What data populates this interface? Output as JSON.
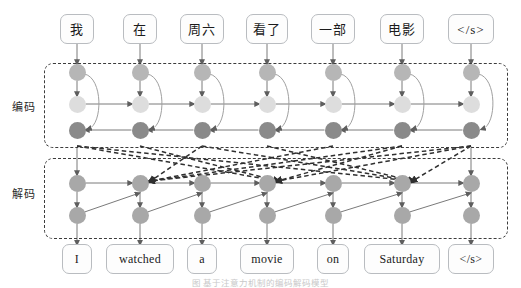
{
  "figure": {
    "caption": "图  基于注意力机制的编码解码模型"
  },
  "sections": {
    "encoder": {
      "label": "编码"
    },
    "decoder": {
      "label": "解码"
    }
  },
  "source_tokens": [
    {
      "text": "我"
    },
    {
      "text": "在"
    },
    {
      "text": "周六"
    },
    {
      "text": "看了"
    },
    {
      "text": "一部"
    },
    {
      "text": "电影"
    },
    {
      "text": "</s>"
    }
  ],
  "target_tokens": [
    {
      "text": "I"
    },
    {
      "text": "watched"
    },
    {
      "text": "a"
    },
    {
      "text": "movie"
    },
    {
      "text": "on"
    },
    {
      "text": "Saturday"
    },
    {
      "text": "</s>"
    }
  ],
  "colors": {
    "node_mid": "#b6b6b6",
    "node_light": "#dddddd",
    "node_dark": "#8a8a8a",
    "node_decoder": "#a8a8a8",
    "frame_border": "#3c3c3c",
    "token_border": "#b9bcc0",
    "arrow": "#6f6f6f",
    "attention_line": "#3a3a3a"
  },
  "layout": {
    "columns": 7,
    "column_x": [
      77,
      140,
      202,
      267,
      333,
      402,
      471
    ],
    "encoder_rows_y": [
      72,
      104,
      130
    ],
    "decoder_rows_y": [
      183,
      215
    ],
    "source_box_y": 14,
    "target_box_y": 244,
    "encoder_frame": {
      "x": 44,
      "y": 63,
      "w": 464,
      "h": 85
    },
    "decoder_frame": {
      "x": 44,
      "y": 158,
      "w": 464,
      "h": 81
    }
  },
  "chart_data": {
    "type": "diagram",
    "encoder": {
      "label": "编码",
      "layers": [
        {
          "name": "embedding",
          "shade": "mid",
          "count": 7
        },
        {
          "name": "forward-rnn",
          "shade": "light",
          "count": 7,
          "direction": "left-to-right"
        },
        {
          "name": "backward-rnn",
          "shade": "dark",
          "count": 7,
          "direction": "right-to-left"
        }
      ]
    },
    "decoder": {
      "label": "解码",
      "layers": [
        {
          "name": "decoder-rnn",
          "shade": "decoder",
          "count": 7,
          "direction": "left-to-right"
        },
        {
          "name": "output-layer",
          "shade": "decoder",
          "count": 7
        }
      ]
    },
    "attention_links": "dashed crossing lines from encoder outputs to decoder states"
  }
}
